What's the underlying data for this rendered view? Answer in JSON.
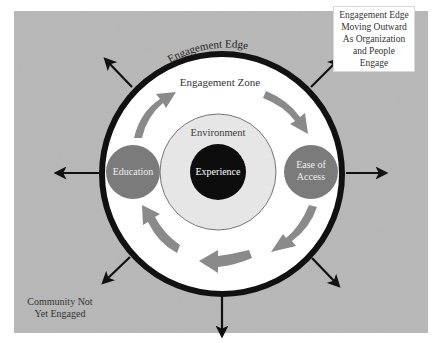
{
  "diagram": {
    "edge_label": "Engagement Edge",
    "zone_label": "Engagement Zone",
    "environment_label": "Environment",
    "experience_label": "Experience",
    "education_label": "Education",
    "ease_label_line1": "Ease of",
    "ease_label_line2": "Access",
    "callout_lines": [
      "Engagement Edge",
      "Moving Outward",
      "As Organization",
      "and People",
      "Engage"
    ],
    "community_lines": [
      "Community Not",
      "Yet Engaged"
    ],
    "colors": {
      "background_panel": "#b9b9b9",
      "ring": "#111111",
      "zone_fill": "#ffffff",
      "environment_fill": "#e6e6e6",
      "experience_fill": "#0d0d0d",
      "node_fill": "#7b7b7b",
      "flow_arrows": "#8a8a8a",
      "outward_arrows": "#111111"
    },
    "outward_arrow_directions": [
      "north-west",
      "north-east",
      "west",
      "east",
      "south-west",
      "south-east",
      "south"
    ]
  }
}
